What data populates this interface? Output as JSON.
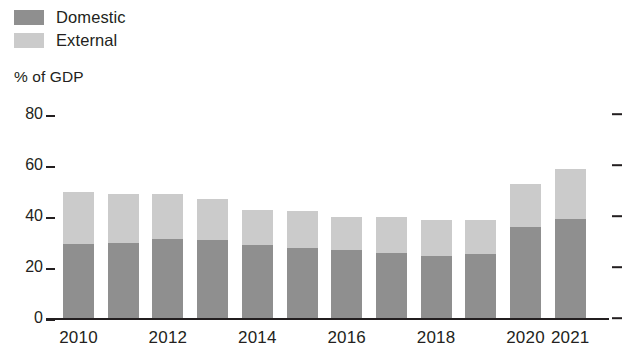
{
  "legend": {
    "position": "top-left",
    "items": [
      {
        "label": "Domestic",
        "color": "#8f8f8f",
        "icon": "square-swatch-icon"
      },
      {
        "label": "External",
        "color": "#cbcbcb",
        "icon": "square-swatch-icon"
      }
    ]
  },
  "axis": {
    "y_title": "% of GDP",
    "y_ticks": [
      "0",
      "20",
      "40",
      "60",
      "80"
    ],
    "x_ticks_visible": [
      "2010",
      "2012",
      "2014",
      "2016",
      "2018",
      "2020",
      "2021"
    ]
  },
  "chart_data": {
    "type": "bar",
    "stacked": true,
    "title": "",
    "subtitle": "",
    "xlabel": "",
    "ylabel": "% of GDP",
    "ylim": [
      0,
      80
    ],
    "ytick_values": [
      0,
      20,
      40,
      60,
      80
    ],
    "grid": false,
    "legend_position": "top-left",
    "categories": [
      "2010",
      "2011",
      "2012",
      "2013",
      "2014",
      "2015",
      "2016",
      "2017",
      "2018",
      "2019",
      "2020",
      "2021"
    ],
    "category_labels_shown": [
      "2010",
      "",
      "2012",
      "",
      "2014",
      "",
      "2016",
      "",
      "2018",
      "",
      "2020",
      "2021"
    ],
    "series": [
      {
        "name": "Domestic",
        "color": "#8f8f8f",
        "values": [
          29.0,
          29.5,
          31.0,
          30.5,
          28.5,
          27.5,
          26.5,
          25.5,
          24.5,
          25.0,
          35.5,
          39.0
        ]
      },
      {
        "name": "External",
        "color": "#cbcbcb",
        "values": [
          20.5,
          19.0,
          17.5,
          16.0,
          14.0,
          14.5,
          13.0,
          14.0,
          14.0,
          13.5,
          17.0,
          19.5
        ]
      }
    ],
    "totals": [
      49.5,
      48.5,
      48.5,
      46.5,
      42.5,
      42.0,
      39.5,
      39.5,
      38.5,
      38.5,
      52.5,
      58.5
    ]
  },
  "style": {
    "axis_color": "#231f20",
    "background": "#ffffff"
  }
}
